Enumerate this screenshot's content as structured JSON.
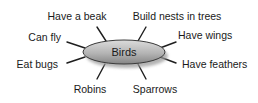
{
  "diagram": {
    "type": "concept-map",
    "center": {
      "label": "Birds",
      "cx": 124,
      "cy": 52,
      "rx": 41,
      "ry": 12
    },
    "nodes": [
      {
        "id": "have-a-beak",
        "label": "Have a beak",
        "x": 77,
        "y": 20,
        "anchor": "middle",
        "line": [
          97,
          27,
          106,
          41
        ]
      },
      {
        "id": "build-nests-in-trees",
        "label": "Build nests in trees",
        "x": 177,
        "y": 20,
        "anchor": "middle",
        "line": [
          146,
          27,
          138,
          41
        ]
      },
      {
        "id": "can-fly",
        "label": "Can fly",
        "x": 61,
        "y": 41,
        "anchor": "end",
        "line": [
          67,
          42,
          85,
          48
        ]
      },
      {
        "id": "have-wings",
        "label": "Have wings",
        "x": 178,
        "y": 39,
        "anchor": "start",
        "line": [
          176,
          42,
          160,
          48
        ]
      },
      {
        "id": "eat-bugs",
        "label": "Eat bugs",
        "x": 58,
        "y": 68,
        "anchor": "end",
        "line": [
          67,
          63,
          85,
          57
        ]
      },
      {
        "id": "have-feathers",
        "label": "Have feathers",
        "x": 182,
        "y": 68,
        "anchor": "start",
        "line": [
          176,
          63,
          160,
          57
        ]
      },
      {
        "id": "robins",
        "label": "Robins",
        "x": 90,
        "y": 93,
        "anchor": "middle",
        "line": [
          97,
          79,
          105,
          64
        ]
      },
      {
        "id": "sparrows",
        "label": "Sparrows",
        "x": 155,
        "y": 93,
        "anchor": "middle",
        "line": [
          146,
          79,
          138,
          64
        ]
      }
    ],
    "colors": {
      "ellipse_top": "#d4d4d4",
      "ellipse_bottom": "#8c8c8c",
      "ellipse_stroke": "#3a3a3a",
      "shadow": "#9a9a9a",
      "line": "#1e1e1e",
      "text": "#1a1a1a"
    }
  }
}
